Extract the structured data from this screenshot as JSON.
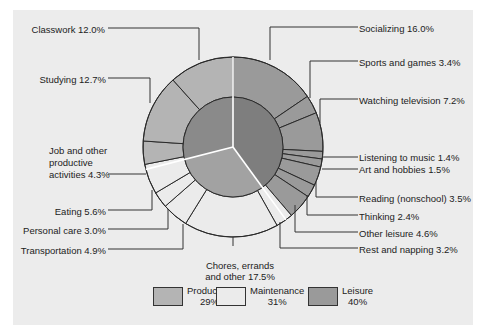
{
  "chart_data": {
    "type": "pie",
    "subtype": "nested-donut",
    "title": "",
    "inner_ring": {
      "categories": [
        "Productive",
        "Maintenance",
        "Leisure"
      ],
      "values": [
        29,
        31,
        40
      ]
    },
    "outer_ring": [
      {
        "label": "Socializing",
        "value": 16.0,
        "group": "Leisure"
      },
      {
        "label": "Sports and games",
        "value": 3.4,
        "group": "Leisure"
      },
      {
        "label": "Watching television",
        "value": 7.2,
        "group": "Leisure"
      },
      {
        "label": "Listening to music",
        "value": 1.4,
        "group": "Leisure"
      },
      {
        "label": "Art and hobbies",
        "value": 1.5,
        "group": "Leisure"
      },
      {
        "label": "Reading (nonschool)",
        "value": 3.5,
        "group": "Leisure"
      },
      {
        "label": "Thinking",
        "value": 2.4,
        "group": "Leisure"
      },
      {
        "label": "Other leisure",
        "value": 4.6,
        "group": "Leisure"
      },
      {
        "label": "Rest and napping",
        "value": 3.2,
        "group": "Maintenance"
      },
      {
        "label": "Chores, errands and other",
        "value": 17.5,
        "group": "Maintenance"
      },
      {
        "label": "Transportation",
        "value": 4.9,
        "group": "Maintenance"
      },
      {
        "label": "Personal care",
        "value": 3.0,
        "group": "Maintenance"
      },
      {
        "label": "Eating",
        "value": 5.6,
        "group": "Maintenance"
      },
      {
        "label": "Job and other productive activities",
        "value": 4.3,
        "group": "Productive"
      },
      {
        "label": "Studying",
        "value": 12.7,
        "group": "Productive"
      },
      {
        "label": "Classwork",
        "value": 12.0,
        "group": "Productive"
      }
    ],
    "legend": [
      {
        "name": "Productive",
        "value": "29%"
      },
      {
        "name": "Maintenance",
        "value": "31%"
      },
      {
        "name": "Leisure",
        "value": "40%"
      }
    ],
    "legend_position": "bottom"
  },
  "labels": {
    "classwork": "Classwork 12.0%",
    "studying": "Studying 12.7%",
    "job_1": "Job and other",
    "job_2": "productive",
    "job_3": "activities 4.3%",
    "eating": "Eating 5.6%",
    "personal_care": "Personal care 3.0%",
    "transportation": "Transportation 4.9%",
    "chores_1": "Chores, errands",
    "chores_2": "and other 17.5%",
    "socializing": "Socializing 16.0%",
    "sports": "Sports and games 3.4%",
    "tv": "Watching television 7.2%",
    "music": "Listening to music 1.4%",
    "art": "Art and hobbies 1.5%",
    "reading": "Reading (nonschool) 3.5%",
    "thinking": "Thinking 2.4%",
    "other_leisure": "Other  leisure 4.6%",
    "rest": "Rest and napping 3.2%"
  },
  "legend": {
    "productive_name": "Productive",
    "productive_pct": "29%",
    "maintenance_name": "Maintenance",
    "maintenance_pct": "31%",
    "leisure_name": "Leisure",
    "leisure_pct": "40%"
  },
  "colors": {
    "background": "#ececec",
    "productive": "#b4b4b4",
    "maintenance": "#ebebeb",
    "leisure": "#9a9a9a",
    "inner_productive": "#8a8a8a",
    "inner_maintenance": "#a2a2a2",
    "inner_leisure": "#7e7e7e"
  }
}
